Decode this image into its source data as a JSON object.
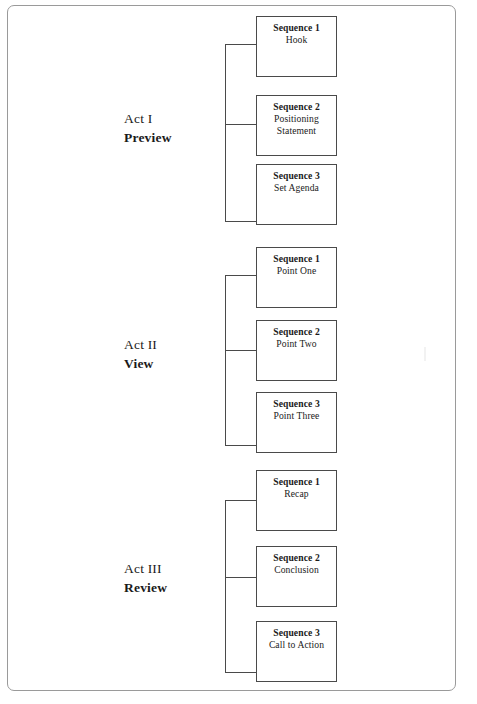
{
  "document": {
    "type": "diagram",
    "title": "Three-Act Presentation Structure",
    "border_color": "#9a9a9a",
    "box_border_color": "#4a4a4a",
    "background": "#ffffff"
  },
  "acts": [
    {
      "name": "Act I",
      "role": "Preview",
      "sequences": [
        {
          "title": "Sequence 1",
          "subtitle": "Hook"
        },
        {
          "title": "Sequence 2",
          "subtitle": "Positioning\nStatement"
        },
        {
          "title": "Sequence 3",
          "subtitle": "Set Agenda"
        }
      ]
    },
    {
      "name": "Act II",
      "role": "View",
      "sequences": [
        {
          "title": "Sequence 1",
          "subtitle": "Point One"
        },
        {
          "title": "Sequence 2",
          "subtitle": "Point Two"
        },
        {
          "title": "Sequence 3",
          "subtitle": "Point Three"
        }
      ]
    },
    {
      "name": "Act III",
      "role": "Review",
      "sequences": [
        {
          "title": "Sequence 1",
          "subtitle": "Recap"
        },
        {
          "title": "Sequence 2",
          "subtitle": "Conclusion"
        },
        {
          "title": "Sequence 3",
          "subtitle": "Call to Action"
        }
      ]
    }
  ]
}
